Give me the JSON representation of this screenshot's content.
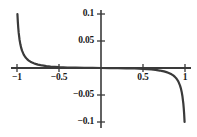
{
  "chart_data": {
    "type": "line",
    "title": "",
    "subtitle": "",
    "xlabel": "",
    "ylabel": "",
    "xlim": [
      -1.05,
      1.05
    ],
    "ylim": [
      -0.11,
      0.11
    ],
    "grid": false,
    "legend": null,
    "axis_style": {
      "spines": "center-crossing",
      "x_axis_y_value": 0,
      "y_axis_x_value": 0,
      "tick_direction": "out",
      "curve_color": "#3a3a3a",
      "axis_color": "#3a3a3a",
      "background": "#ffffff"
    },
    "xticks": [
      -1,
      -0.5,
      0.5,
      1
    ],
    "xtick_labels": [
      "-1",
      "-0.5",
      "0.5",
      "1"
    ],
    "yticks": [
      0.1,
      0.05,
      -0.05,
      -0.1
    ],
    "ytick_labels": [
      "0.1",
      "0.05",
      "-0.05",
      "-0.1"
    ],
    "annotations": [],
    "series": [
      {
        "name": "left-branch",
        "description": "Branch with vertical asymptote at x = -1, decaying to 0 from above",
        "x": [
          -0.995,
          -0.99,
          -0.985,
          -0.98,
          -0.97,
          -0.96,
          -0.95,
          -0.94,
          -0.92,
          -0.9,
          -0.88,
          -0.86,
          -0.84,
          -0.82,
          -0.8,
          -0.78,
          -0.75,
          -0.72,
          -0.7,
          -0.65,
          -0.6,
          -0.55,
          -0.5,
          -0.4,
          -0.3,
          -0.2,
          -0.1,
          0.0
        ],
        "y": [
          0.1,
          0.0855,
          0.0742,
          0.0655,
          0.0528,
          0.0438,
          0.0372,
          0.0321,
          0.0248,
          0.0199,
          0.0164,
          0.0138,
          0.0117,
          0.0101,
          0.0088,
          0.0077,
          0.0063,
          0.0053,
          0.0047,
          0.0035,
          0.0027,
          0.0021,
          0.0016,
          0.00094,
          0.00053,
          0.00025,
          8e-05,
          0.0
        ]
      },
      {
        "name": "right-branch",
        "description": "Branch with vertical asymptote at x = 1, decaying to 0 from below",
        "x": [
          0.0,
          0.1,
          0.2,
          0.3,
          0.4,
          0.5,
          0.55,
          0.6,
          0.65,
          0.7,
          0.72,
          0.75,
          0.78,
          0.8,
          0.82,
          0.84,
          0.86,
          0.88,
          0.9,
          0.92,
          0.94,
          0.95,
          0.96,
          0.97,
          0.98,
          0.985,
          0.99,
          0.995
        ],
        "y": [
          0.0,
          -8e-05,
          -0.00025,
          -0.00053,
          -0.00094,
          -0.0016,
          -0.0021,
          -0.0027,
          -0.0035,
          -0.0047,
          -0.0053,
          -0.0063,
          -0.0077,
          -0.0088,
          -0.0101,
          -0.0117,
          -0.0138,
          -0.0164,
          -0.0199,
          -0.0248,
          -0.0321,
          -0.0372,
          -0.0438,
          -0.0528,
          -0.0655,
          -0.0742,
          -0.0855,
          -0.1
        ]
      }
    ]
  }
}
